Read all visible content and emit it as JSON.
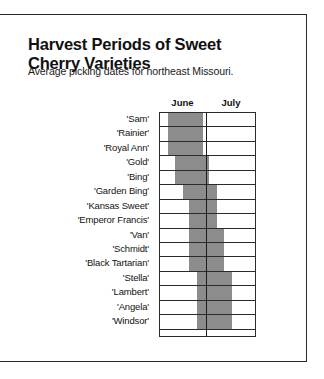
{
  "title": {
    "line1": "Harvest Periods of Sweet",
    "line2": "Cherry Varieties"
  },
  "subtitle": "Average picking dates for northeast Missouri.",
  "chart_data": {
    "type": "bar",
    "orientation": "horizontal-range",
    "title": "Harvest Periods of Sweet Cherry Varieties",
    "subtitle": "Average picking dates for northeast Missouri.",
    "xlabel": "",
    "ylabel": "",
    "grid": true,
    "legend_position": "none",
    "axis_tick_labels": [
      "June",
      "July"
    ],
    "x_axis": {
      "start_day": 1,
      "end_day": 62,
      "months": [
        {
          "name": "June",
          "start_day": 1,
          "end_day": 30,
          "days": 30
        },
        {
          "name": "July",
          "start_day": 31,
          "end_day": 62,
          "days": 32
        }
      ]
    },
    "bar_color": "#8c8c8c",
    "categories": [
      "'Sam'",
      "'Rainier'",
      "'Royal Ann'",
      "'Gold'",
      "'Bing'",
      "'Garden Bing'",
      "'Kansas Sweet'",
      "'Emperor Francis'",
      "'Van'",
      "'Schmidt'",
      "'Black Tartarian'",
      "'Stella'",
      "'Lambert'",
      "'Angela'",
      "'Windsor'"
    ],
    "series": [
      {
        "name": "Harvest period",
        "units": "day-of-span (1 = June 1, 62 = July 31)",
        "ranges": [
          {
            "category": "'Sam'",
            "start": 6,
            "end": 28,
            "start_date": "June 6",
            "end_date": "June 28"
          },
          {
            "category": "'Rainier'",
            "start": 6,
            "end": 28,
            "start_date": "June 6",
            "end_date": "June 28"
          },
          {
            "category": "'Royal Ann'",
            "start": 6,
            "end": 28,
            "start_date": "June 6",
            "end_date": "June 28"
          },
          {
            "category": "'Gold'",
            "start": 11,
            "end": 32,
            "start_date": "June 11",
            "end_date": "July 2"
          },
          {
            "category": "'Bing'",
            "start": 11,
            "end": 32,
            "start_date": "June 11",
            "end_date": "July 2"
          },
          {
            "category": "'Garden Bing'",
            "start": 16,
            "end": 37,
            "start_date": "June 16",
            "end_date": "July 7"
          },
          {
            "category": "'Kansas Sweet'",
            "start": 20,
            "end": 37,
            "start_date": "June 20",
            "end_date": "July 7"
          },
          {
            "category": "'Emperor Francis'",
            "start": 20,
            "end": 37,
            "start_date": "June 20",
            "end_date": "July 7"
          },
          {
            "category": "'Van'",
            "start": 20,
            "end": 42,
            "start_date": "June 20",
            "end_date": "July 12"
          },
          {
            "category": "'Schmidt'",
            "start": 20,
            "end": 42,
            "start_date": "June 20",
            "end_date": "July 12"
          },
          {
            "category": "'Black Tartarian'",
            "start": 20,
            "end": 42,
            "start_date": "June 20",
            "end_date": "July 12"
          },
          {
            "category": "'Stella'",
            "start": 25,
            "end": 47,
            "start_date": "June 25",
            "end_date": "July 17"
          },
          {
            "category": "'Lambert'",
            "start": 25,
            "end": 47,
            "start_date": "June 25",
            "end_date": "July 17"
          },
          {
            "category": "'Angela'",
            "start": 25,
            "end": 47,
            "start_date": "June 25",
            "end_date": "July 17"
          },
          {
            "category": "'Windsor'",
            "start": 25,
            "end": 47,
            "start_date": "June 25",
            "end_date": "July 17"
          }
        ]
      }
    ]
  }
}
